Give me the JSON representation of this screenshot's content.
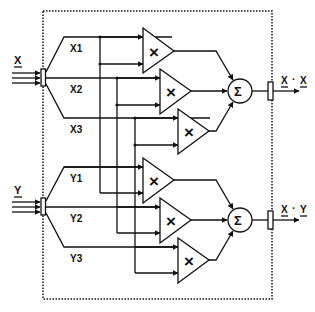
{
  "diagram": {
    "type": "block-diagram",
    "inputs": {
      "x": {
        "label": "X",
        "underlined": true,
        "components": [
          "X1",
          "X2",
          "X3"
        ]
      },
      "y": {
        "label": "Y",
        "underlined": true,
        "components": [
          "Y1",
          "Y2",
          "Y3"
        ]
      }
    },
    "multiplier_symbol": "×",
    "sum_symbol": "Σ",
    "outputs": [
      {
        "label": "X · X",
        "left": "X",
        "dot": "·",
        "right": "X"
      },
      {
        "label": "X · Y",
        "left": "X",
        "dot": "·",
        "right": "Y"
      }
    ],
    "groups": [
      {
        "name": "x-dot-x",
        "multipliers": [
          [
            "X1",
            "X1"
          ],
          [
            "X2",
            "X2"
          ],
          [
            "X3",
            "X3"
          ]
        ],
        "output": "X · X"
      },
      {
        "name": "x-dot-y",
        "multipliers": [
          [
            "Y1",
            "X1"
          ],
          [
            "Y2",
            "X2"
          ],
          [
            "Y3",
            "X3"
          ]
        ],
        "output": "X · Y"
      }
    ],
    "colors": {
      "line": "#111111",
      "background": "#ffffff"
    }
  }
}
